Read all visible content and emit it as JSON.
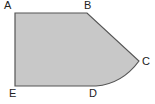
{
  "diagram": {
    "shape": "pentagon-with-curved-edge",
    "fill_color": "#c8c8c8",
    "stroke_color": "#555555",
    "vertices": [
      {
        "label": "A",
        "x": 15,
        "y": 13
      },
      {
        "label": "B",
        "x": 87,
        "y": 13
      },
      {
        "label": "C",
        "x": 139,
        "y": 61
      },
      {
        "label": "D",
        "x": 96,
        "y": 86
      },
      {
        "label": "E",
        "x": 15,
        "y": 86
      }
    ],
    "edges": [
      {
        "from": "A",
        "to": "B",
        "type": "straight"
      },
      {
        "from": "B",
        "to": "C",
        "type": "straight"
      },
      {
        "from": "C",
        "to": "D",
        "type": "arc"
      },
      {
        "from": "D",
        "to": "E",
        "type": "straight"
      },
      {
        "from": "E",
        "to": "A",
        "type": "straight"
      }
    ],
    "labels": {
      "a": "A",
      "b": "B",
      "c": "C",
      "d": "D",
      "e": "E"
    }
  }
}
